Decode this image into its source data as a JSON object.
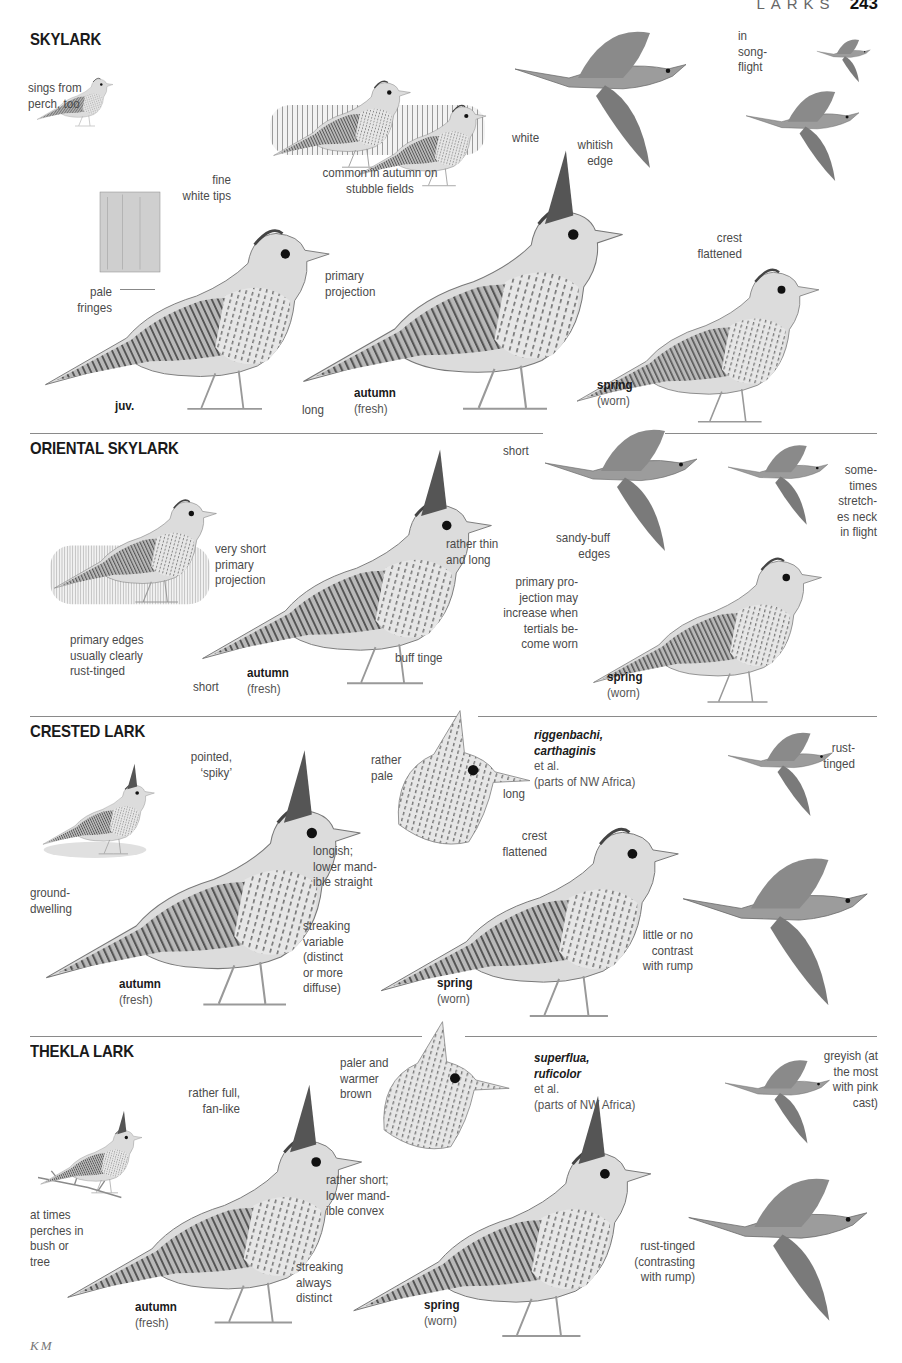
{
  "page": {
    "running_head": "LARKS",
    "page_number": "243",
    "illustrator_credit": "KM"
  },
  "colors": {
    "text": "#4a4a4a",
    "title": "#1a1a1a",
    "divider": "#8a8a8a",
    "plumage_dark": "#4d4d4d",
    "plumage_mid": "#8c8c8c",
    "plumage_light": "#d6d6d6"
  },
  "sections": [
    {
      "title": "SKYLARK",
      "annotations": {
        "perch": "sings from\nperch, too",
        "stubble": "common in autumn on\nstubble fields",
        "white": "white",
        "whitish_edge": "whitish\nedge",
        "songflight": "in\nsong-\nflight",
        "fine_white_tips": "fine\nwhite tips",
        "pale_fringes": "pale\nfringes",
        "primary_projection": "primary\nprojection",
        "long": "long",
        "crest_flattened": "crest\nflattened"
      },
      "plumages": [
        {
          "name": "juv.",
          "note": ""
        },
        {
          "name": "autumn",
          "note": "(fresh)"
        },
        {
          "name": "spring",
          "note": "(worn)"
        }
      ]
    },
    {
      "title": "ORIENTAL SKYLARK",
      "annotations": {
        "primary_edges": "primary edges\nusually clearly\nrust-tinged",
        "very_short_pp": "very short\nprimary\nprojection",
        "short_tail": "short",
        "rather_thin": "rather thin\nand long",
        "buff_tinge": "buff tinge",
        "short_flight": "short",
        "sandy_buff": "sandy-buff\nedges",
        "sometimes": "some-\ntimes\nstretch-\nes neck\nin flight",
        "pp_increase": "primary pro-\njection may\nincrease when\ntertials be-\ncome worn"
      },
      "plumages": [
        {
          "name": "autumn",
          "note": "(fresh)"
        },
        {
          "name": "spring",
          "note": "(worn)"
        }
      ]
    },
    {
      "title": "CRESTED LARK",
      "annotations": {
        "ground": "ground-\ndwelling",
        "pointed": "pointed,\n‘spiky’",
        "longish": "longish;\nlower mand-\nible straight",
        "streaking": "streaking\nvariable\n(distinct\nor more\ndiffuse)",
        "rather_pale": "rather\npale",
        "long_bill": "long",
        "crest_flattened": "crest\nflattened",
        "rust_tinged": "rust-\ntinged",
        "little_contrast": "little or no\ncontrast\nwith rump"
      },
      "subspecies": {
        "names_line1": "riggenbachi,",
        "names_line2": "carthaginis",
        "suffix": " et al.",
        "range": "(parts of NW Africa)"
      },
      "plumages": [
        {
          "name": "autumn",
          "note": "(fresh)"
        },
        {
          "name": "spring",
          "note": "(worn)"
        }
      ]
    },
    {
      "title": "THEKLA LARK",
      "annotations": {
        "perches": "at times\nperches in\nbush or\ntree",
        "rather_full": "rather full,\nfan-like",
        "paler_warmer": "paler and\nwarmer\nbrown",
        "rather_short": "rather short;\nlower mand-\nible convex",
        "streaking": "streaking\nalways\ndistinct",
        "greyish": "greyish (at\nthe most\nwith pink\ncast)",
        "rust_tinged": "rust-tinged\n(contrasting\nwith rump)"
      },
      "subspecies": {
        "names_line1": "superflua,",
        "names_line2": "ruficolor",
        "suffix": " et al.",
        "range": "(parts of NW Africa)"
      },
      "plumages": [
        {
          "name": "autumn",
          "note": "(fresh)"
        },
        {
          "name": "spring",
          "note": "(worn)"
        }
      ]
    }
  ]
}
